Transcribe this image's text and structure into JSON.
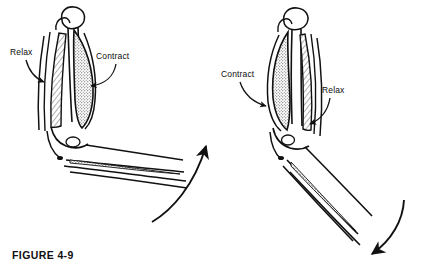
{
  "figure": {
    "caption": "FIGURE 4-9",
    "background_color": "#ffffff",
    "ink_color": "#111111",
    "panels": [
      {
        "id": "left-panel",
        "name": "arm-extended",
        "description": "Arm extended at the elbow",
        "labels": [
          {
            "id": "relax-left",
            "text": "Relax",
            "target": "triceps",
            "leader": "curved-arrow-pointing-right"
          },
          {
            "id": "contract-left",
            "text": "Contract",
            "target": "biceps",
            "leader": "curved-arrow-pointing-left-down"
          }
        ]
      },
      {
        "id": "right-panel",
        "name": "arm-flexed",
        "description": "Arm flexed at the elbow",
        "labels": [
          {
            "id": "contract-right",
            "text": "Contract",
            "target": "biceps",
            "leader": "curved-arrow-pointing-right-down"
          },
          {
            "id": "relax-right",
            "text": "Relax",
            "target": "triceps",
            "leader": "curved-arrow-pointing-left-down"
          }
        ]
      }
    ],
    "motion_arrows": [
      {
        "id": "flexion-arrow",
        "direction": "up-right",
        "position": "center-lower",
        "meaning": "flexion"
      },
      {
        "id": "extension-arrow",
        "direction": "down-right",
        "position": "bottom-right",
        "meaning": "extension"
      }
    ]
  },
  "labels": {
    "relax_left": "Relax",
    "contract_left": "Contract",
    "contract_right": "Contract",
    "relax_right": "Relax"
  }
}
